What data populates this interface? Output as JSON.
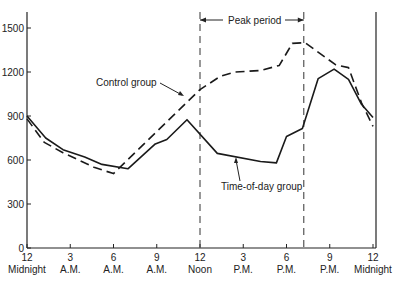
{
  "chart_data": {
    "type": "line",
    "title": "",
    "xlabel": "",
    "ylabel": "",
    "ylim": [
      0,
      1500
    ],
    "xlim": [
      0,
      24
    ],
    "grid": false,
    "yticks": [
      0,
      300,
      600,
      900,
      1200,
      1500
    ],
    "xticks": [
      {
        "hour": 0,
        "top": "12",
        "bottom": "Midnight"
      },
      {
        "hour": 3,
        "top": "3",
        "bottom": "A.M."
      },
      {
        "hour": 6,
        "top": "6",
        "bottom": "A.M."
      },
      {
        "hour": 9,
        "top": "9",
        "bottom": "A.M."
      },
      {
        "hour": 12,
        "top": "12",
        "bottom": "Noon"
      },
      {
        "hour": 15,
        "top": "3",
        "bottom": "P.M."
      },
      {
        "hour": 18,
        "top": "6",
        "bottom": "P.M."
      },
      {
        "hour": 21,
        "top": "9",
        "bottom": "P.M."
      },
      {
        "hour": 24,
        "top": "12",
        "bottom": "Midnight"
      }
    ],
    "series": [
      {
        "name": "Control group",
        "style": "dashed",
        "points": [
          [
            0,
            880
          ],
          [
            1.2,
            720
          ],
          [
            2.5,
            650
          ],
          [
            4.7,
            548
          ],
          [
            6,
            507
          ],
          [
            12,
            1080
          ],
          [
            13.4,
            1170
          ],
          [
            14.4,
            1200
          ],
          [
            16.2,
            1210
          ],
          [
            17.5,
            1245
          ],
          [
            18.4,
            1395
          ],
          [
            19.3,
            1400
          ],
          [
            21.4,
            1250
          ],
          [
            22.3,
            1230
          ],
          [
            23.2,
            990
          ],
          [
            24,
            830
          ]
        ]
      },
      {
        "name": "Time-of-day group",
        "style": "solid",
        "points": [
          [
            0,
            900
          ],
          [
            1.3,
            750
          ],
          [
            2.5,
            670
          ],
          [
            4,
            620
          ],
          [
            5.2,
            570
          ],
          [
            7,
            540
          ],
          [
            8.9,
            710
          ],
          [
            9.7,
            740
          ],
          [
            11.1,
            875
          ],
          [
            13.2,
            645
          ],
          [
            16.2,
            590
          ],
          [
            17.3,
            580
          ],
          [
            18,
            760
          ],
          [
            19.1,
            815
          ],
          [
            20.2,
            1155
          ],
          [
            21.3,
            1220
          ],
          [
            22.3,
            1150
          ],
          [
            23.2,
            980
          ],
          [
            24,
            890
          ]
        ]
      }
    ],
    "annotations": [
      {
        "text": "Peak period",
        "type": "span",
        "start_hour": 12,
        "end_hour": 19.2
      },
      {
        "text": "Control group",
        "type": "label-arrow"
      },
      {
        "text": "Time-of-day group",
        "type": "label-arrow"
      }
    ]
  },
  "labels": {
    "peak": "Peak period",
    "control": "Control group",
    "tod": "Time-of-day group"
  }
}
